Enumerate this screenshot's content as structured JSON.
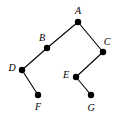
{
  "diagram": {
    "type": "tree-graph",
    "width": 116,
    "height": 119,
    "background_color": "#ffffff",
    "edge_color": "#000000",
    "node_color": "#000000",
    "label_color": "#000000",
    "node_radius": 3.2,
    "edge_width": 1.1,
    "nodes": [
      {
        "id": "A",
        "label": "A",
        "x": 78,
        "y": 22,
        "label_x": 78,
        "label_y": 11
      },
      {
        "id": "B",
        "label": "B",
        "x": 47,
        "y": 48,
        "label_x": 42,
        "label_y": 38
      },
      {
        "id": "C",
        "label": "C",
        "x": 103,
        "y": 52,
        "label_x": 107,
        "label_y": 42
      },
      {
        "id": "D",
        "label": "D",
        "x": 22,
        "y": 70,
        "label_x": 12,
        "label_y": 68
      },
      {
        "id": "E",
        "label": "E",
        "x": 76,
        "y": 77,
        "label_x": 66,
        "label_y": 75
      },
      {
        "id": "F",
        "label": "F",
        "x": 38,
        "y": 95,
        "label_x": 38,
        "label_y": 107
      },
      {
        "id": "G",
        "label": "G",
        "x": 91,
        "y": 95,
        "label_x": 91,
        "label_y": 108
      }
    ],
    "edges": [
      {
        "from": "A",
        "to": "B"
      },
      {
        "from": "A",
        "to": "C"
      },
      {
        "from": "B",
        "to": "D"
      },
      {
        "from": "C",
        "to": "E"
      },
      {
        "from": "D",
        "to": "F"
      },
      {
        "from": "E",
        "to": "G"
      }
    ]
  }
}
